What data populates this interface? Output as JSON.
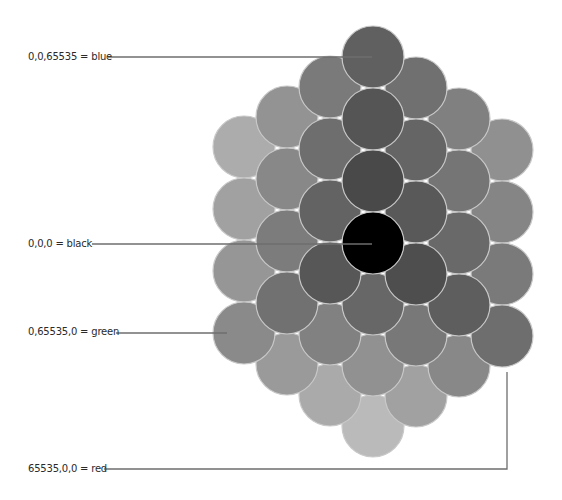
{
  "diagram": {
    "type": "rgb-color-cube-isometric",
    "grid_levels": 4,
    "level_values": [
      0,
      21845,
      43690,
      65535
    ],
    "origin_px": [
      373,
      243
    ],
    "step_red_px": [
      43,
      31
    ],
    "step_green_px": [
      -43,
      30
    ],
    "step_blue_px": [
      0,
      -62
    ],
    "circle_radius_px": 31,
    "circle_outline_color": "#c9c9c9",
    "gray_min": 80,
    "gray_max": 228,
    "corners": {
      "black": {
        "rgb": [
          0,
          0,
          0
        ],
        "fill": "#000000"
      },
      "blue": {
        "rgb": [
          0,
          0,
          65535
        ]
      },
      "green": {
        "rgb": [
          0,
          65535,
          0
        ]
      },
      "red": {
        "rgb": [
          65535,
          0,
          0
        ]
      }
    }
  },
  "labels": [
    {
      "id": "blue",
      "text": "0,0,65535 = blue",
      "x": 28,
      "y": 51,
      "line": [
        [
          108,
          57
        ],
        [
          372,
          57
        ]
      ]
    },
    {
      "id": "black",
      "text": "0,0,0 = black",
      "x": 28,
      "y": 238,
      "line": [
        [
          92,
          244
        ],
        [
          372,
          244
        ]
      ]
    },
    {
      "id": "green",
      "text": "0,65535,0 = green",
      "x": 28,
      "y": 326,
      "line": [
        [
          116,
          333
        ],
        [
          227,
          333
        ]
      ]
    },
    {
      "id": "red",
      "text": "65535,0,0 = red",
      "x": 28,
      "y": 463,
      "line": [
        [
          104,
          469
        ],
        [
          507,
          469
        ],
        [
          507,
          372
        ]
      ]
    }
  ],
  "line_color": "#6e6e6e"
}
